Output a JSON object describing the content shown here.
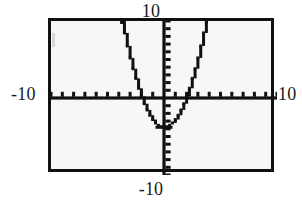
{
  "screen": {
    "title": "",
    "background_color": "#f7f7f7",
    "frame_color": "#111111",
    "curve_color": "#111111",
    "axis_color": "#111111"
  },
  "window_labels": {
    "ymax": "10",
    "ymin": "-10",
    "xmin": "-10",
    "xmax": "10"
  },
  "icons": {
    "screen_frame": "rectangle-frame-icon",
    "x_axis": "horizontal-axis-icon",
    "y_axis": "vertical-axis-icon",
    "curve": "parabola-curve-icon"
  },
  "chart_data": {
    "type": "line",
    "title": "",
    "xlabel": "",
    "ylabel": "",
    "xlim": [
      -10,
      10
    ],
    "ylim": [
      -10,
      10
    ],
    "xtick_interval": 1,
    "ytick_interval": 1,
    "grid": false,
    "legend": "none",
    "axis_style": "tick-marked-axes-through-origin",
    "annotations": [
      {
        "text": "10",
        "position": "top-center-outside",
        "meaning": "y-maximum"
      },
      {
        "text": "-10",
        "position": "bottom-center-outside",
        "meaning": "y-minimum"
      },
      {
        "text": "-10",
        "position": "left-middle-outside",
        "meaning": "x-minimum"
      },
      {
        "text": "10",
        "position": "right-middle-outside",
        "meaning": "x-maximum"
      }
    ],
    "series": [
      {
        "name": "parabola",
        "equation": "y = x^2 - 4",
        "vertex": [
          0,
          -3.8
        ],
        "x_intercepts": [
          -1.9,
          2.0
        ],
        "y_intercept": -3.8,
        "rendering": "stair-stepped pixel trace",
        "x": [
          -3.75,
          -3.5,
          -3.25,
          -3.0,
          -2.75,
          -2.5,
          -2.25,
          -2.0,
          -1.75,
          -1.5,
          -1.25,
          -1.0,
          -0.75,
          -0.5,
          -0.25,
          0,
          0.25,
          0.5,
          0.75,
          1.0,
          1.25,
          1.5,
          1.75,
          2.0,
          2.25,
          2.5,
          2.75,
          3.0,
          3.25,
          3.5,
          3.75
        ],
        "y": [
          10.3,
          8.45,
          6.76,
          5.2,
          3.8,
          2.55,
          1.26,
          0.2,
          -0.74,
          -1.55,
          -2.24,
          -2.8,
          -3.24,
          -3.55,
          -3.74,
          -3.8,
          -3.74,
          -3.55,
          -3.24,
          -2.8,
          -2.24,
          -1.55,
          -0.74,
          0.2,
          1.26,
          2.55,
          3.8,
          5.2,
          6.76,
          8.45,
          10.3
        ]
      }
    ]
  }
}
